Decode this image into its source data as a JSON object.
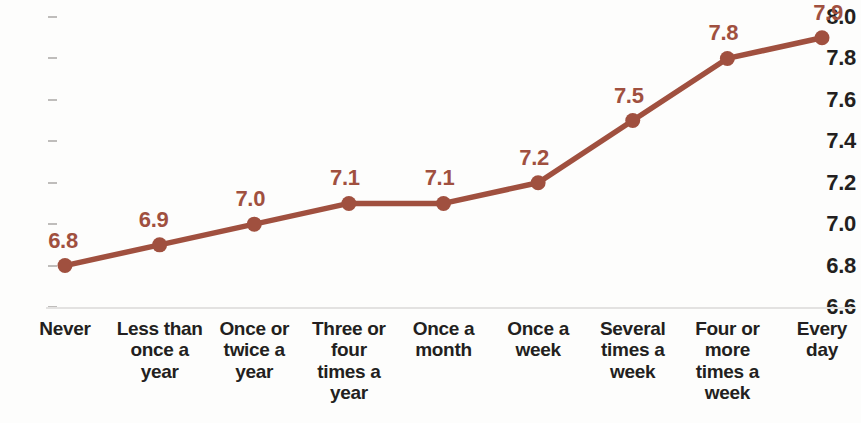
{
  "chart_data": {
    "type": "line",
    "title": "",
    "subtitle": "",
    "xlabel": "",
    "ylabel": "",
    "categories": [
      "Never",
      "Less than once a year",
      "Once or twice a year",
      "Three or four times a year",
      "Once a month",
      "Once a week",
      "Several times a week",
      "Four or more times a week",
      "Every day"
    ],
    "category_lines": [
      [
        "Never"
      ],
      [
        "Less than",
        "once a",
        "year"
      ],
      [
        "Once or",
        "twice a",
        "year"
      ],
      [
        "Three or",
        "four",
        "times a",
        "year"
      ],
      [
        "Once a",
        "month"
      ],
      [
        "Once a",
        "week"
      ],
      [
        "Several",
        "times a",
        "week"
      ],
      [
        "Four or",
        "more",
        "times a",
        "week"
      ],
      [
        "Every",
        "day"
      ]
    ],
    "values": [
      6.8,
      6.9,
      7.0,
      7.1,
      7.1,
      7.2,
      7.5,
      7.8,
      7.9
    ],
    "point_labels": [
      "6.8",
      "6.9",
      "7.0",
      "7.1",
      "7.1",
      "7.2",
      "7.5",
      "7.8",
      "7.9"
    ],
    "ylim": [
      6.6,
      8.0
    ],
    "ytick_values": [
      8.0,
      7.8,
      7.6,
      7.4,
      7.2,
      7.0,
      6.8,
      6.6
    ],
    "ytick_labels": [
      "8.0",
      "7.8",
      "7.6",
      "7.4",
      "7.2",
      "7.0",
      "6.8",
      "6.6"
    ],
    "grid": false,
    "legend": "none",
    "series_color": "#a0503f",
    "marker": "circle",
    "axis_text_color": "#231f20",
    "baseline_color": "#e3e2e1",
    "background_color": "#fdfdfc"
  }
}
